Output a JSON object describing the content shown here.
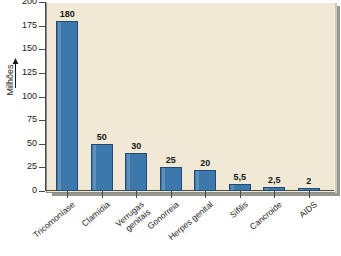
{
  "chart_data": {
    "type": "bar",
    "title": "",
    "subtitle": "",
    "xlabel": "",
    "ylabel": "Milhões",
    "ylim": [
      0,
      200
    ],
    "ytick_values": [
      200,
      175,
      150,
      125,
      100,
      75,
      50,
      25,
      0
    ],
    "ytick_labels": [
      "200",
      "175",
      "150",
      "125",
      "100",
      "75",
      "50",
      "25",
      "0"
    ],
    "grid": false,
    "legend": "none",
    "bar_color": "#3c78ab",
    "bar_edge_color": "#1d4b73",
    "panel_color": "#f1e9d6",
    "categories": [
      "Tricomoníase",
      "Clamídia",
      "Verrugas\ngenitais",
      "Gonorreia",
      "Herpes genital",
      "Sífilis",
      "Cancroide",
      "AIDS"
    ],
    "values": [
      180,
      50,
      40,
      25,
      22,
      7,
      4,
      3
    ],
    "data_labels": [
      "180",
      "50",
      "30",
      "25",
      "20",
      "5,5",
      "2,5",
      "2"
    ],
    "axis_arrow": "up-arrow-icon"
  }
}
